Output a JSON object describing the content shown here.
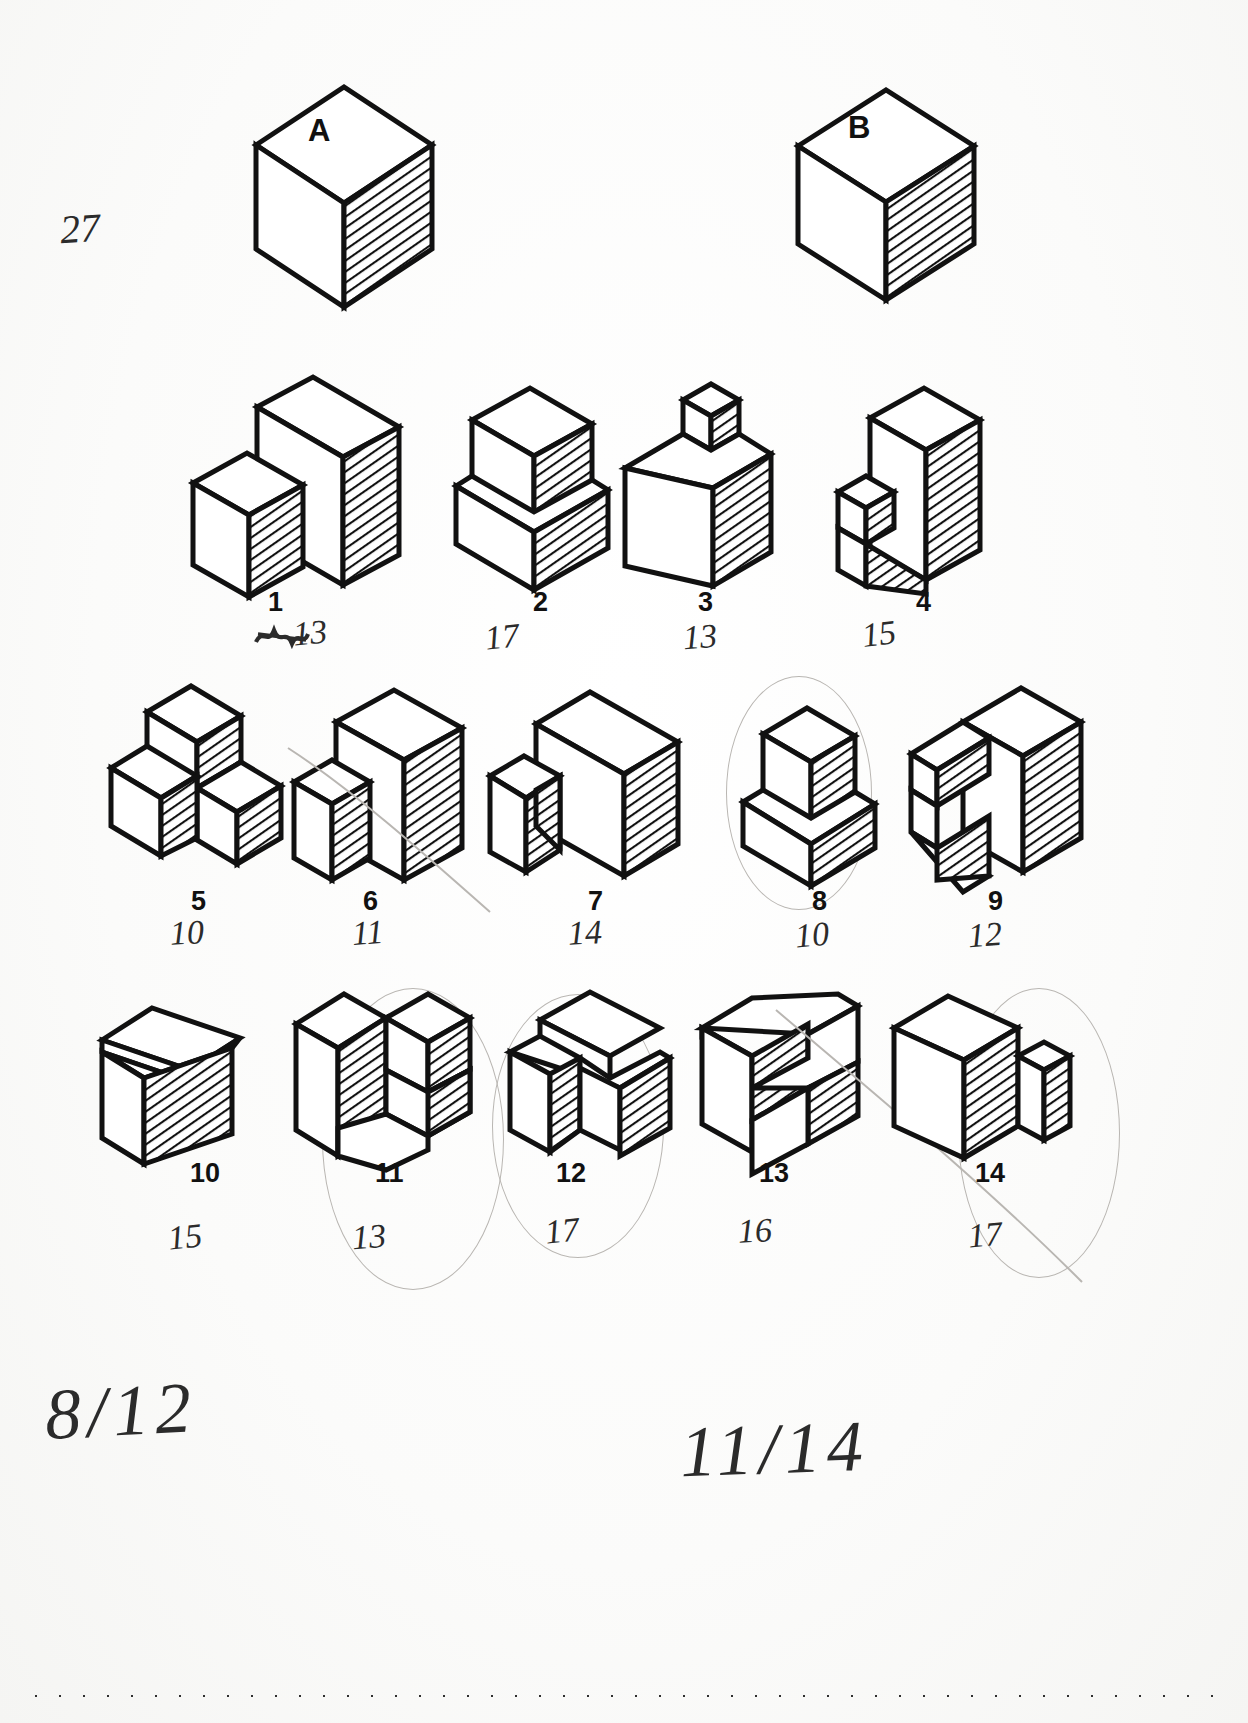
{
  "page": {
    "page_number_handwritten": "27"
  },
  "reference_cubes": [
    {
      "letter": "A",
      "name": "cube-a"
    },
    {
      "letter": "B",
      "name": "cube-b"
    }
  ],
  "figures": [
    {
      "label": "1",
      "annotation": "13",
      "annotation_struck": true,
      "circled": false
    },
    {
      "label": "2",
      "annotation": "17",
      "annotation_struck": false,
      "circled": false
    },
    {
      "label": "3",
      "annotation": "13",
      "annotation_struck": false,
      "circled": false
    },
    {
      "label": "4",
      "annotation": "15",
      "annotation_struck": false,
      "circled": false
    },
    {
      "label": "5",
      "annotation": "10",
      "annotation_struck": false,
      "circled": false
    },
    {
      "label": "6",
      "annotation": "11",
      "annotation_struck": false,
      "circled": false
    },
    {
      "label": "7",
      "annotation": "14",
      "annotation_struck": false,
      "circled": false
    },
    {
      "label": "8",
      "annotation": "10",
      "annotation_struck": false,
      "circled": true
    },
    {
      "label": "9",
      "annotation": "12",
      "annotation_struck": false,
      "circled": false
    },
    {
      "label": "10",
      "annotation": "15",
      "annotation_struck": false,
      "circled": false
    },
    {
      "label": "11",
      "annotation": "13",
      "annotation_struck": false,
      "circled": true
    },
    {
      "label": "12",
      "annotation": "17",
      "annotation_struck": false,
      "circled": true
    },
    {
      "label": "13",
      "annotation": "16",
      "annotation_struck": false,
      "circled": false
    },
    {
      "label": "14",
      "annotation": "17",
      "annotation_struck": false,
      "circled": true
    }
  ],
  "footer": {
    "score_left": "8/12",
    "score_right": "11/14"
  },
  "colors": {
    "ink": "#111111",
    "paper": "#fdfdfc",
    "pencil": "#b9b6b2",
    "handwriting": "#2b2b2b"
  }
}
